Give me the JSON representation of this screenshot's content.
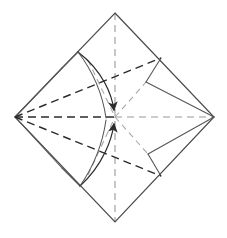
{
  "figure": {
    "kind": "origami-step-diagram",
    "canvas": {
      "width": 227,
      "height": 238
    },
    "background_color": "#ffffff"
  },
  "colors": {
    "outline": "#4a4a4a",
    "crease_dark": "#2b2b2b",
    "crease_light": "#9a9a9a",
    "arrow": "#3a3a3a",
    "background": "#ffffff"
  },
  "geometry": {
    "vertices": {
      "top": {
        "x": 115,
        "y": 13
      },
      "right": {
        "x": 214,
        "y": 117
      },
      "bottom": {
        "x": 115,
        "y": 222
      },
      "left": {
        "x": 15,
        "y": 117
      },
      "center": {
        "x": 115,
        "y": 117
      }
    },
    "edge_points": {
      "upper_right_crease_end": {
        "x": 161,
        "y": 58
      },
      "lower_right_crease_end": {
        "x": 161,
        "y": 176
      },
      "upper_left_arc_start": {
        "x": 78,
        "y": 52
      },
      "lower_left_arc_start": {
        "x": 80,
        "y": 186
      },
      "upper_left_tick_outer": {
        "x": 62,
        "y": 68
      },
      "lower_left_tick_outer": {
        "x": 62,
        "y": 168
      },
      "upper_edge_fold_point": {
        "x": 88,
        "y": 60
      },
      "lower_edge_fold_point": {
        "x": 88,
        "y": 175
      }
    }
  },
  "shapes": {
    "outline": {
      "name": "square-sheet-outline",
      "style": "solid",
      "points": "115,13 214,117 115,222 15,117"
    },
    "creases_dashed_dark": [
      {
        "name": "crease-left-to-center-horizontal",
        "from": "left",
        "to": "center"
      },
      {
        "name": "crease-left-to-upper-right-edge",
        "from": "left",
        "to": "upper_right_crease_end"
      },
      {
        "name": "crease-left-to-lower-right-edge",
        "from": "left",
        "to": "lower_right_crease_end"
      },
      {
        "name": "crease-center-to-upper-right-edge",
        "from": "center",
        "to": "upper_right_crease_end"
      },
      {
        "name": "crease-center-to-lower-right-edge",
        "from": "center",
        "to": "lower_right_crease_end"
      }
    ],
    "creases_dashed_light": [
      {
        "name": "crease-vertical-top-to-bottom",
        "from": "top",
        "to": "bottom"
      },
      {
        "name": "crease-center-to-right-horizontal",
        "from": "center",
        "to": "right"
      },
      {
        "name": "crease-upper-left-diagonal",
        "from": "upper_edge_fold_point",
        "to": "center"
      },
      {
        "name": "crease-lower-left-diagonal",
        "from": "lower_edge_fold_point",
        "to": "center"
      },
      {
        "name": "crease-upper-right-diagonal",
        "from": "center",
        "to": "upper_right_diag"
      },
      {
        "name": "crease-lower-right-diagonal",
        "from": "center",
        "to": "lower_right_diag"
      }
    ],
    "arrows": [
      {
        "name": "fold-arrow-upper",
        "type": "curved-arrow",
        "direction": "down-right",
        "start": {
          "x": 78,
          "y": 52
        },
        "end": {
          "x": 115,
          "y": 117
        },
        "meaning": "fold upper-left flap to center"
      },
      {
        "name": "fold-arrow-lower",
        "type": "curved-arrow",
        "direction": "up-right",
        "start": {
          "x": 80,
          "y": 186
        },
        "end": {
          "x": 115,
          "y": 117
        },
        "meaning": "fold lower-left flap to center"
      }
    ],
    "tick_marks": [
      {
        "name": "tick-upper-left",
        "from": {
          "x": 62,
          "y": 68
        },
        "to": {
          "x": 78,
          "y": 52
        }
      },
      {
        "name": "tick-lower-left",
        "from": {
          "x": 62,
          "y": 168
        },
        "to": {
          "x": 80,
          "y": 186
        }
      }
    ]
  },
  "labels": {
    "figure_caption": "",
    "step_number": ""
  }
}
